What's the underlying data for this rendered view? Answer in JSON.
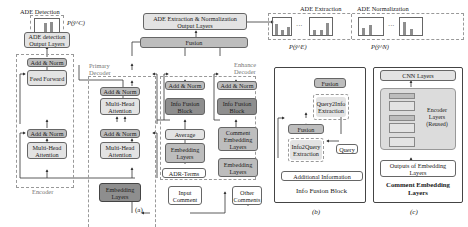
{
  "panel_a": {
    "caption": "(a)",
    "ade_detection": {
      "title": "ADE Detection",
      "prob_label": "P(ŷ^C)",
      "output_layers": "ADE detection Output Layers"
    },
    "encoder": {
      "label": "Encoder",
      "add_norm_top": "Add & Norm",
      "feed_forward": "Feed Forward",
      "add_norm_bottom": "Add & Norm",
      "attention": "Multi-Head Attention"
    },
    "primary_decoder": {
      "label": "Primary Decoder",
      "add_norm_top": "Add & Norm",
      "attention_top": "Multi-Head Attention",
      "add_norm_bottom": "Add & Norm",
      "attention_bottom": "Multi-Head Attention",
      "embedding": "Embedding Layers"
    },
    "enhance_decoder": {
      "label": "Enhance Decoder",
      "left": {
        "add_norm": "Add & Norm",
        "info_fusion": "Info Fusion Block",
        "average": "Average",
        "embedding": "Embedding Layers",
        "adr_terms": "ADR-Terms"
      },
      "right": {
        "add_norm": "Add & Norm",
        "info_fusion": "Info Fusion Block",
        "comment_embedding": "Comment Embedding Layers",
        "embedding": "Embedding Layers"
      }
    },
    "fusion": "Fusion",
    "output_layers": "ADE Extraction & Normalization Output Layers",
    "input_comment": "Input Comment",
    "other_comments": "Other Comments"
  },
  "top_outputs": {
    "extraction": {
      "title": "ADE Extraction",
      "prob_label": "P(ŷ^E)",
      "bar_labels_1": [
        "B",
        "I",
        "O"
      ],
      "bar_labels_2": [
        "B",
        "I",
        "O"
      ],
      "ellipsis": "···"
    },
    "normalization": {
      "title": "ADE Normalization",
      "prob_label": "P(ŷ^N)",
      "bar_labels_1": [
        "N1",
        "N2"
      ],
      "bar_labels_2": [
        "N1",
        "N2"
      ],
      "ellipsis": "···"
    }
  },
  "panel_b": {
    "caption": "(b)",
    "title": "Info Fusion Block",
    "fusion_top": "Fusion",
    "query2info": "Query2Info Extraction",
    "fusion_mid": "Fusion",
    "info2query": "Info2Query Extraction",
    "query": "Query",
    "additional_info": "Additional Information"
  },
  "panel_c": {
    "caption": "(c)",
    "title": "Comment Embedding Layers",
    "cnn": "CNN Layers",
    "encoder_layers": "Encoder Layers (Reused)",
    "outputs": "Outputs of Embedding Layers"
  }
}
